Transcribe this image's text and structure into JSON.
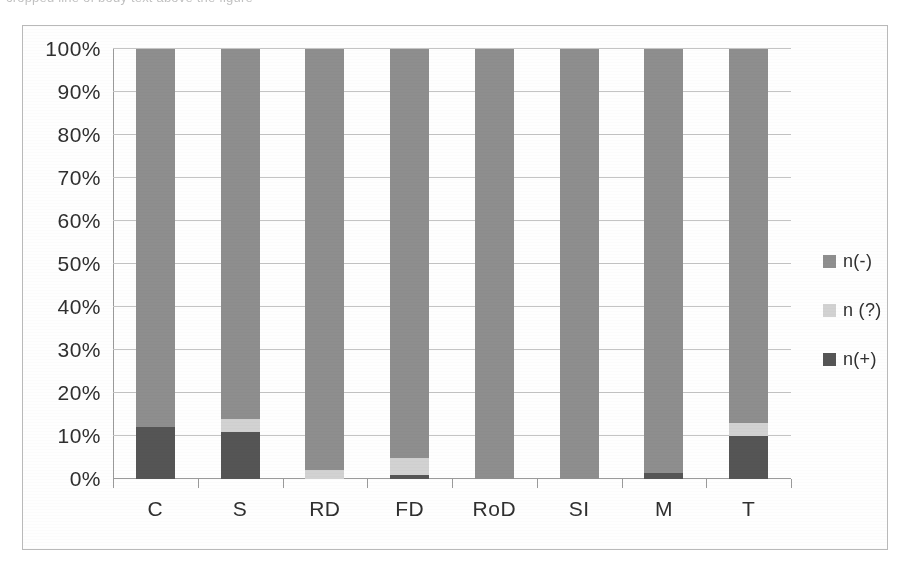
{
  "page": {
    "top_text_fragment": "cropped line of body text above the figure"
  },
  "colors": {
    "n_minus": "#8e8e8e",
    "n_question": "#d2d2d2",
    "n_plus": "#555555",
    "gridline": "#c4c4c4",
    "axis": "#9a9a9a",
    "frame": "#b9b9b9",
    "text": "#2f2f2f",
    "background": "#fefefe"
  },
  "legend": {
    "position": "right",
    "items": [
      {
        "label": "n(-)",
        "color": "#8e8e8e",
        "swatch_name": "legend-swatch-n-minus"
      },
      {
        "label": "n (?)",
        "color": "#d2d2d2",
        "swatch_name": "legend-swatch-n-question"
      },
      {
        "label": "n(+)",
        "color": "#555555",
        "swatch_name": "legend-swatch-n-plus"
      }
    ]
  },
  "chart_data": {
    "type": "bar",
    "subtype": "stacked-100-percent",
    "title": "",
    "xlabel": "",
    "ylabel": "",
    "ylim": [
      0,
      100
    ],
    "grid": true,
    "legend_position": "right",
    "categories": [
      "C",
      "S",
      "RD",
      "FD",
      "RoD",
      "SI",
      "M",
      "T"
    ],
    "tick_labels": [
      "0%",
      "10%",
      "20%",
      "30%",
      "40%",
      "50%",
      "60%",
      "70%",
      "80%",
      "90%",
      "100%"
    ],
    "tick_values": [
      0,
      10,
      20,
      30,
      40,
      50,
      60,
      70,
      80,
      90,
      100
    ],
    "series": [
      {
        "name": "n(+)",
        "color": "#555555",
        "values": [
          12,
          11,
          0,
          1,
          0,
          0,
          1.5,
          10
        ]
      },
      {
        "name": "n (?)",
        "color": "#d2d2d2",
        "values": [
          0,
          3,
          2,
          4,
          0,
          0,
          0,
          3
        ]
      },
      {
        "name": "n(-)",
        "color": "#8e8e8e",
        "values": [
          88,
          86,
          98,
          95,
          100,
          100,
          98.5,
          87
        ]
      }
    ],
    "stack_order_bottom_to_top": [
      "n(+)",
      "n (?)",
      "n(-)"
    ]
  }
}
